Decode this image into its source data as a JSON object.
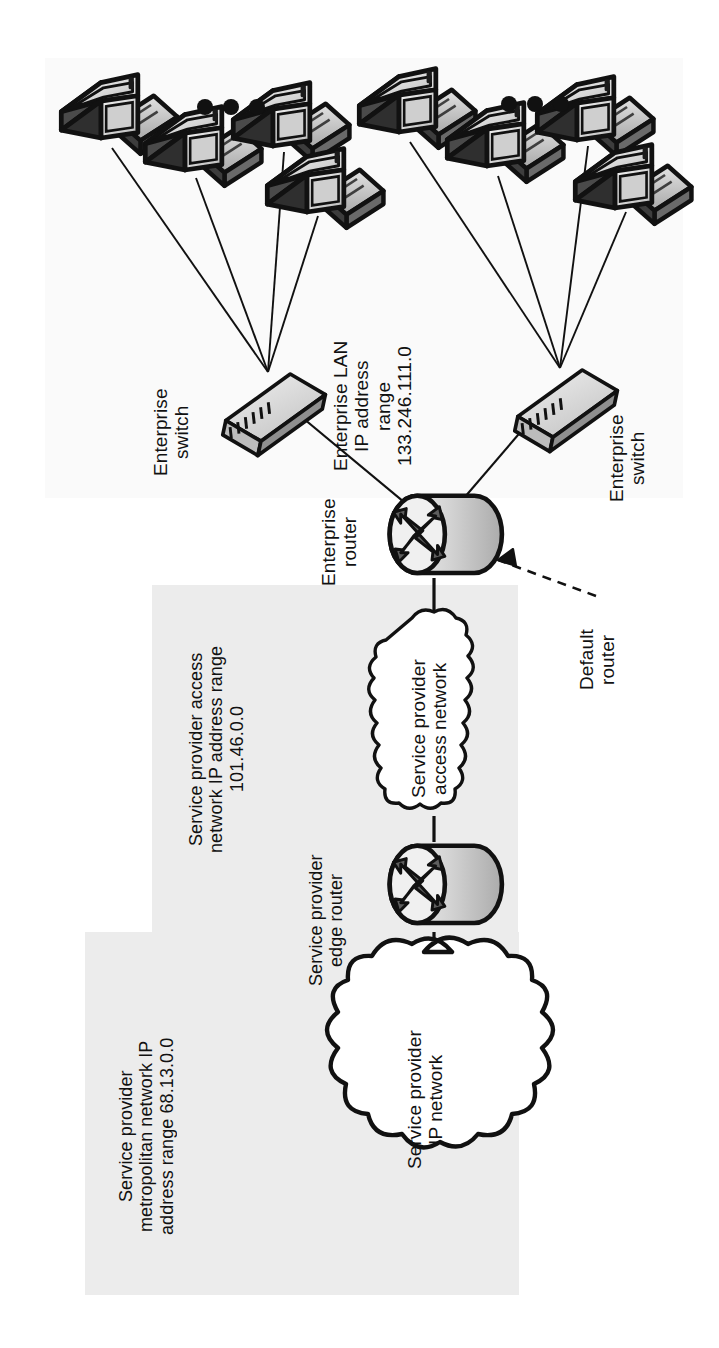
{
  "diagram": {
    "orientation": "rotated-90-ccw",
    "background": "#ffffff",
    "panel_color": "#ececec",
    "lan_panel_color": "#fafafa",
    "ink_color": "#111111",
    "device_fill_light": "#e9e9e9",
    "device_fill_mid": "#c9c9c9"
  },
  "regions": [
    {
      "id": "enterprise-lan-region",
      "name": "Enterprise LAN region",
      "label": "Enterprise LAN\nIP address\nrange\n133.246.111.0",
      "ip_range": "133.246.111.0"
    },
    {
      "id": "sp-access-region",
      "name": "Service provider access network region",
      "label": "Service provider access\nnetwork IP address range\n101.46.0.0",
      "ip_range": "101.46.0.0"
    },
    {
      "id": "sp-metro-region",
      "name": "Service provider metropolitan network region",
      "label": "Service provider\nmetropolitan network IP\naddress range 68.13.0.0",
      "ip_range": "68.13.0.0"
    }
  ],
  "labels": {
    "enterprise_switch_left": "Enterprise\nswitch",
    "enterprise_switch_right": "Enterprise\nswitch",
    "enterprise_router": "Enterprise\nrouter",
    "default_router": "Default\nrouter",
    "sp_edge_router": "Service provider\nedge router",
    "enterprise_lan": "Enterprise LAN\nIP address\nrange\n133.246.111.0",
    "sp_access_region": "Service provider access\nnetwork IP address range\n101.46.0.0",
    "sp_metro_region": "Service provider\nmetropolitan network IP\naddress range 68.13.0.0"
  },
  "clouds": [
    {
      "id": "sp-access-cloud",
      "label": "Service provider\naccess network",
      "shape": "narrow-cloud"
    },
    {
      "id": "sp-ip-cloud",
      "label": "Service provider\nIP network",
      "shape": "wide-cloud"
    }
  ],
  "nodes": [
    {
      "id": "switch-left",
      "type": "switch",
      "label": "Enterprise switch"
    },
    {
      "id": "switch-right",
      "type": "switch",
      "label": "Enterprise switch"
    },
    {
      "id": "router-enterprise",
      "type": "router",
      "label": "Enterprise router"
    },
    {
      "id": "router-sp-edge",
      "type": "router",
      "label": "Service provider edge router"
    }
  ],
  "workstations": {
    "left_group_count": 4,
    "right_group_count": 4,
    "icon": "workstation-icon",
    "ellipsis": "•••"
  },
  "annotations": [
    {
      "id": "default-router-arrow",
      "style": "dashed-arrow",
      "points_to": "router-enterprise",
      "text": "Default\nrouter"
    }
  ]
}
